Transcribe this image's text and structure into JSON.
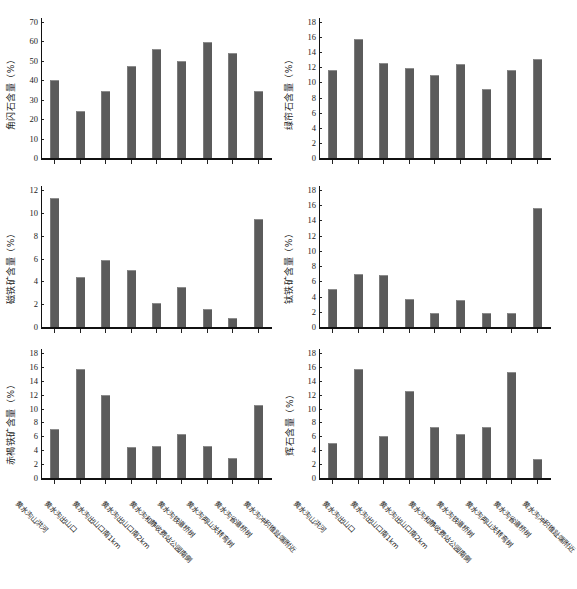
{
  "figure": {
    "bar_color": "#5b5b5b",
    "axis_color": "#111111",
    "background": "#ffffff",
    "categories": [
      "黄水沟山洪河",
      "黄水沟出山口",
      "黄水沟出山口南1km",
      "黄水沟出山口南2km",
      "黄水沟和静收费站公园南侧",
      "黄水沟铁道桥树",
      "黄水沟两山关转弯树",
      "黄水沟省道桥树",
      "黄水沟冲积锥趾端附近"
    ]
  },
  "chart_data": [
    {
      "type": "bar",
      "id": "amphibole",
      "title": "",
      "ylabel": "角闪石含量（%）",
      "xlabel": "",
      "ylim": [
        0,
        70
      ],
      "yticks": [
        0,
        10,
        20,
        30,
        40,
        50,
        60,
        70
      ],
      "grid": false,
      "legend": "none",
      "categories": [
        "黄水沟山洪河",
        "黄水沟出山口",
        "黄水沟出山口南1km",
        "黄水沟出山口南2km",
        "黄水沟和静收费站公园南侧",
        "黄水沟铁道桥树",
        "黄水沟两山关转弯树",
        "黄水沟省道桥树",
        "黄水沟冲积锥趾端附近"
      ],
      "values": [
        40.4,
        24.2,
        34.5,
        47.5,
        56.3,
        49.7,
        59.5,
        54.3,
        34.7
      ]
    },
    {
      "type": "bar",
      "id": "epidote",
      "title": "",
      "ylabel": "绿帘石含量（%）",
      "xlabel": "",
      "ylim": [
        0,
        18
      ],
      "yticks": [
        0,
        2,
        4,
        6,
        8,
        10,
        12,
        14,
        16,
        18
      ],
      "grid": false,
      "legend": "none",
      "categories": [
        "黄水沟山洪河",
        "黄水沟出山口",
        "黄水沟出山口南1km",
        "黄水沟出山口南2km",
        "黄水沟和静收费站公园南侧",
        "黄水沟铁道桥树",
        "黄水沟两山关转弯树",
        "黄水沟省道桥树",
        "黄水沟冲积锥趾端附近"
      ],
      "values": [
        11.6,
        15.7,
        12.6,
        11.9,
        11.0,
        12.4,
        9.1,
        11.7,
        13.1
      ]
    },
    {
      "type": "bar",
      "id": "magnetite",
      "title": "",
      "ylabel": "磁铁矿含量（%）",
      "xlabel": "",
      "ylim": [
        0,
        12
      ],
      "yticks": [
        0,
        2,
        4,
        6,
        8,
        10,
        12
      ],
      "grid": false,
      "legend": "none",
      "categories": [
        "黄水沟山洪河",
        "黄水沟出山口",
        "黄水沟出山口南1km",
        "黄水沟出山口南2km",
        "黄水沟和静收费站公园南侧",
        "黄水沟铁道桥树",
        "黄水沟两山关转弯树",
        "黄水沟省道桥树",
        "黄水沟冲积锥趾端附近"
      ],
      "values": [
        11.3,
        4.4,
        5.9,
        5.0,
        2.1,
        3.5,
        1.6,
        0.8,
        9.5
      ]
    },
    {
      "type": "bar",
      "id": "ilmenite",
      "title": "",
      "ylabel": "钛铁矿含量（%）",
      "xlabel": "",
      "ylim": [
        0,
        18
      ],
      "yticks": [
        0,
        2,
        4,
        6,
        8,
        10,
        12,
        14,
        16,
        18
      ],
      "grid": false,
      "legend": "none",
      "categories": [
        "黄水沟山洪河",
        "黄水沟出山口",
        "黄水沟出山口南1km",
        "黄水沟出山口南2km",
        "黄水沟和静收费站公园南侧",
        "黄水沟铁道桥树",
        "黄水沟两山关转弯树",
        "黄水沟省道桥树",
        "黄水沟冲积锥趾端附近"
      ],
      "values": [
        5.0,
        7.0,
        6.8,
        3.7,
        1.9,
        3.6,
        1.9,
        1.9,
        15.7
      ]
    },
    {
      "type": "bar",
      "id": "hematite-limonite",
      "title": "",
      "ylabel": "赤褐铁矿含量（%）",
      "xlabel": "",
      "ylim": [
        0,
        18
      ],
      "yticks": [
        0,
        2,
        4,
        6,
        8,
        10,
        12,
        14,
        16,
        18
      ],
      "grid": false,
      "legend": "none",
      "categories": [
        "黄水沟山洪河",
        "黄水沟出山口",
        "黄水沟出山口南1km",
        "黄水沟出山口南2km",
        "黄水沟和静收费站公园南侧",
        "黄水沟铁道桥树",
        "黄水沟两山关转弯树",
        "黄水沟省道桥树",
        "黄水沟冲积锥趾端附近"
      ],
      "values": [
        7.0,
        15.7,
        11.9,
        4.5,
        4.6,
        6.3,
        4.6,
        2.9,
        10.5
      ]
    },
    {
      "type": "bar",
      "id": "pyroxene",
      "title": "",
      "ylabel": "辉石含量（%）",
      "xlabel": "",
      "ylim": [
        0,
        18
      ],
      "yticks": [
        0,
        2,
        4,
        6,
        8,
        10,
        12,
        14,
        16,
        18
      ],
      "grid": false,
      "legend": "none",
      "categories": [
        "黄水沟山洪河",
        "黄水沟出山口",
        "黄水沟出山口南1km",
        "黄水沟出山口南2km",
        "黄水沟和静收费站公园南侧",
        "黄水沟铁道桥树",
        "黄水沟两山关转弯树",
        "黄水沟省道桥树",
        "黄水沟冲积锥趾端附近"
      ],
      "values": [
        5.0,
        15.7,
        6.0,
        12.5,
        7.4,
        6.3,
        7.3,
        15.3,
        2.7
      ]
    }
  ]
}
